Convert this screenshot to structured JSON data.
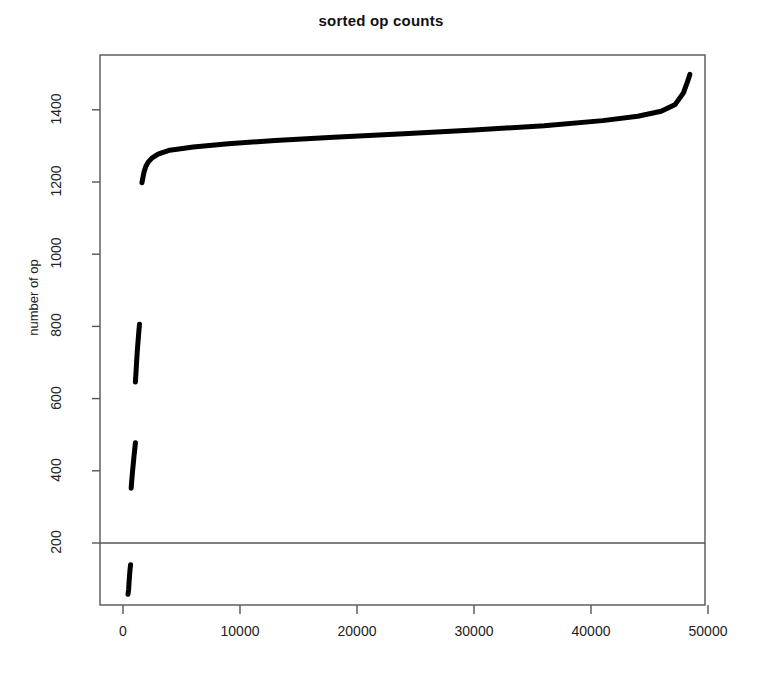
{
  "chart_data": {
    "type": "line",
    "title": "sorted op counts",
    "xlabel": "",
    "ylabel": "number of op",
    "xlim": [
      -1500,
      51500
    ],
    "ylim": [
      20,
      1560
    ],
    "xticks": [
      0,
      10000,
      20000,
      30000,
      40000,
      50000
    ],
    "xtick_labels": [
      "0",
      "10000",
      "20000",
      "30000",
      "40000",
      "50000"
    ],
    "yticks": [
      200,
      400,
      600,
      800,
      1000,
      1200,
      1400
    ],
    "ytick_labels": [
      "200",
      "400",
      "600",
      "800",
      "1000",
      "1200",
      "1400"
    ],
    "grid": false,
    "legend": null,
    "box": true,
    "annotations": [
      {
        "type": "hline",
        "y": 200,
        "label": "reference line at 200",
        "color": "#555555"
      }
    ],
    "series": [
      {
        "name": "sorted op counts",
        "color": "#000000",
        "linewidth": 5,
        "segments": [
          {
            "name": "bottom-cluster",
            "x": [
              430,
              480,
              520,
              560,
              600,
              650
            ],
            "y": [
              58,
              72,
              92,
              110,
              126,
              140
            ]
          },
          {
            "name": "low-cluster",
            "x": [
              700,
              760,
              820,
              880,
              940,
              1000,
              1060
            ],
            "y": [
              352,
              378,
              400,
              420,
              440,
              458,
              478
            ]
          },
          {
            "name": "mid-cluster",
            "x": [
              1060,
              1110,
              1160,
              1210,
              1260,
              1310,
              1360,
              1410
            ],
            "y": [
              646,
              672,
              700,
              726,
              748,
              768,
              788,
              806
            ]
          },
          {
            "name": "main-curve",
            "x": [
              1620,
              1700,
              1800,
              1950,
              2150,
              2500,
              3000,
              4000,
              6000,
              9000,
              13000,
              18000,
              24000,
              30000,
              36000,
              41000,
              44000,
              46000,
              47200,
              47900,
              48250,
              48450
            ],
            "y": [
              1198,
              1212,
              1228,
              1243,
              1255,
              1267,
              1277,
              1288,
              1297,
              1306,
              1315,
              1324,
              1334,
              1344,
              1356,
              1370,
              1382,
              1396,
              1415,
              1447,
              1478,
              1498
            ]
          }
        ]
      }
    ]
  },
  "geometry": {
    "plot_left": 100,
    "plot_right": 705,
    "plot_top": 55,
    "plot_bottom": 605,
    "x0_px": 123,
    "x_px_per_unit": 0.0117,
    "y200_px": 543,
    "y_px_per_unit": 0.361
  }
}
